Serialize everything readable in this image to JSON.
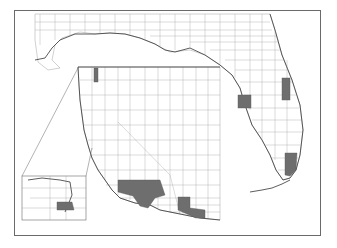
{
  "figure": {
    "type": "county choropleth map",
    "panels": [
      {
        "name": "gulf-coast-florida",
        "description": "Gulf Coast and Florida county boundaries"
      },
      {
        "name": "western-us",
        "description": "Western US county boundaries (WA, OR, ID, CA, NV, AZ)"
      },
      {
        "name": "inset-washington",
        "description": "Zoomed inset of Puget Sound area, Washington"
      }
    ],
    "highlight_color": "#6e6e6e",
    "boundary_color": "#8a8a8a",
    "highlighted_counties": {
      "florida": [
        "Brevard area (east coast)",
        "Hillsborough/Polk area (west central)",
        "Miami-Dade area (south)"
      ],
      "california": [
        "San Bernardino",
        "Los Angeles",
        "Riverside",
        "Ventura/Santa Barbara area"
      ],
      "arizona": [
        "Maricopa",
        "Pinal/Pima area"
      ],
      "washington": [
        "King/Snohomish area (Puget Sound)"
      ]
    }
  }
}
